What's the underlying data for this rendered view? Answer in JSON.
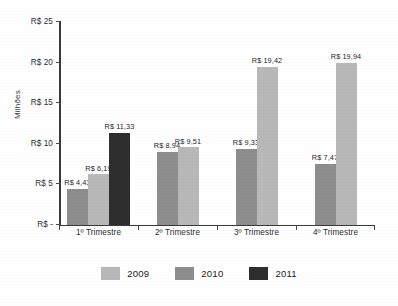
{
  "chart_data": {
    "type": "bar",
    "title": "",
    "subtitle": "",
    "xlabel": "",
    "ylabel": "Milhões",
    "categories": [
      "1º Trimestre",
      "2º Trimestre",
      "3º Trimestre",
      "4º Trimestre"
    ],
    "series": [
      {
        "name": "2010",
        "color": "#8d8d8d",
        "values": [
          4.43,
          8.94,
          9.33,
          7.47
        ],
        "labels": [
          "R$ 4,43",
          "R$ 8,94",
          "R$ 9,33",
          "R$ 7,47"
        ]
      },
      {
        "name": "2009",
        "color": "#b8b8b8",
        "values": [
          6.19,
          9.51,
          19.42,
          19.94
        ],
        "labels": [
          "R$ 6,19",
          "R$ 9,51",
          "R$ 19,42",
          "R$ 19,94"
        ]
      },
      {
        "name": "2011",
        "color": "#2e2e2e",
        "values": [
          11.33,
          null,
          null,
          null
        ],
        "labels": [
          "R$ 11,33",
          "",
          "",
          ""
        ]
      }
    ],
    "ylim": [
      0,
      25
    ],
    "yticks": [
      0,
      5,
      10,
      15,
      20,
      25
    ],
    "ytick_labels": [
      "R$  -",
      "R$ 5",
      "R$ 10",
      "R$ 15",
      "R$ 20",
      "R$ 25"
    ],
    "grid": false,
    "legend_position": "bottom",
    "legend": [
      "2009",
      "2010",
      "2011"
    ],
    "value_labels_shown": true,
    "currency_prefix": "R$",
    "units": "Milhões"
  },
  "legend_items": [
    {
      "label": "2009",
      "color": "#b8b8b8"
    },
    {
      "label": "2010",
      "color": "#8d8d8d"
    },
    {
      "label": "2011",
      "color": "#2e2e2e"
    }
  ],
  "axis": {
    "y_title": "Milhões"
  }
}
